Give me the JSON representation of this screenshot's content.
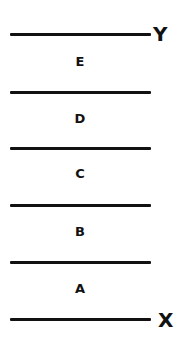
{
  "diagram": {
    "top_label": "Y",
    "bottom_label": "X",
    "layers_top_to_bottom": [
      {
        "label": "E"
      },
      {
        "label": "D"
      },
      {
        "label": "C"
      },
      {
        "label": "B"
      },
      {
        "label": "A"
      }
    ],
    "line_color": "#111111",
    "background": "#ffffff"
  }
}
